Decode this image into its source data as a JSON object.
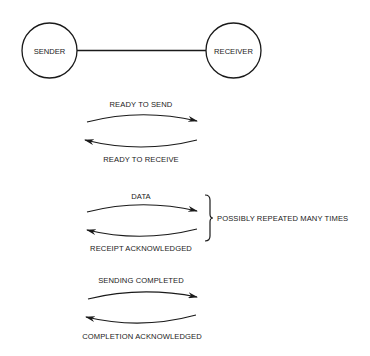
{
  "nodes": {
    "sender": {
      "label": "SENDER"
    },
    "receiver": {
      "label": "RECEIVER"
    }
  },
  "exchanges": [
    {
      "forward": "READY TO SEND",
      "backward": "READY TO RECEIVE"
    },
    {
      "forward": "DATA",
      "backward": "RECEIPT ACKNOWLEDGED"
    },
    {
      "forward": "SENDING COMPLETED",
      "backward": "COMPLETION ACKNOWLEDGED"
    }
  ],
  "annotation": {
    "brace_label": "POSSIBLY REPEATED MANY TIMES"
  },
  "colors": {
    "ink": "#1a1a1a",
    "background": "#ffffff"
  }
}
